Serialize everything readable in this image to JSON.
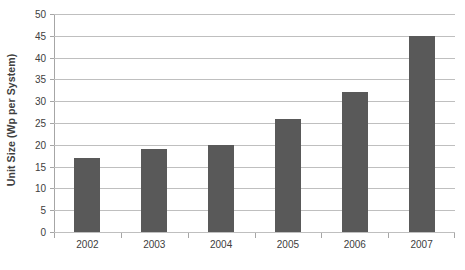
{
  "chart_data": {
    "type": "bar",
    "title": "",
    "xlabel": "",
    "ylabel": "Unit Size (Wp per System)",
    "categories": [
      "2002",
      "2003",
      "2004",
      "2005",
      "2006",
      "2007"
    ],
    "values": [
      17,
      19,
      20,
      26,
      32,
      45
    ],
    "series": [
      {
        "name": "Unit Size (Wp per System)",
        "values": [
          17,
          19,
          20,
          26,
          32,
          45
        ]
      }
    ],
    "ylim": [
      0,
      50
    ],
    "yticks": [
      0,
      5,
      10,
      15,
      20,
      25,
      30,
      35,
      40,
      45,
      50
    ],
    "ytick_labels": [
      "0",
      "5",
      "10",
      "15",
      "20",
      "25",
      "30",
      "35",
      "40",
      "45",
      "50"
    ],
    "grid": true,
    "grid_axis": "y",
    "legend": false,
    "legend_position": "none",
    "colors": {
      "bar_fill": "#595959",
      "gridline": "#bfbfbf",
      "axis_line": "#a6a6a6",
      "text": "#404040",
      "axis_title_text": "#3f3f3f",
      "background": "#ffffff"
    }
  }
}
